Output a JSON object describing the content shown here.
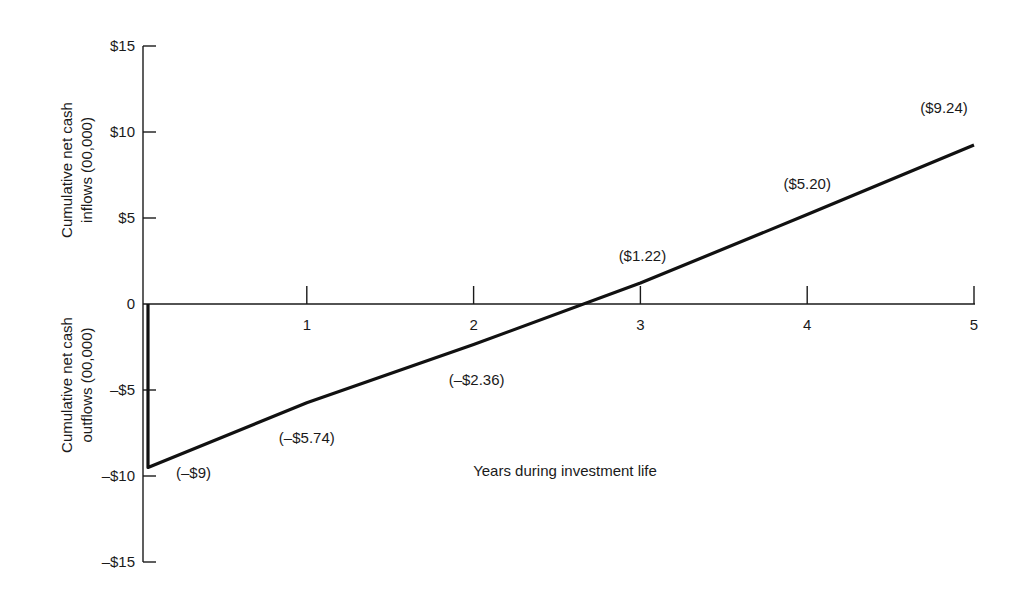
{
  "chart_data": {
    "type": "line",
    "title": "",
    "xlabel": "Years during investment life",
    "ylabel_positive": [
      "Cumulative net cash",
      "inflows (00,000)"
    ],
    "ylabel_negative": [
      "Cumulative net cash",
      "outflows (00,000)"
    ],
    "x": [
      0,
      0,
      1,
      2,
      3,
      4,
      5
    ],
    "y": [
      0,
      -9,
      -5.74,
      -2.36,
      1.22,
      5.2,
      9.24
    ],
    "point_labels": [
      {
        "x": 0,
        "y": -9,
        "label": "(–$9)"
      },
      {
        "x": 1,
        "y": -5.74,
        "label": "(–$5.74)"
      },
      {
        "x": 2,
        "y": -2.36,
        "label": "(–$2.36)"
      },
      {
        "x": 3,
        "y": 1.22,
        "label": "($1.22)"
      },
      {
        "x": 4,
        "y": 5.2,
        "label": "($5.20)"
      },
      {
        "x": 5,
        "y": 9.24,
        "label": "($9.24)"
      }
    ],
    "xticks": [
      1,
      2,
      3,
      4,
      5
    ],
    "xtick_labels": [
      "1",
      "2",
      "3",
      "4",
      "5"
    ],
    "yticks": [
      15,
      10,
      5,
      0,
      -5,
      -10,
      -15
    ],
    "ytick_labels": [
      "$15",
      "$10",
      "$5",
      "0",
      "–$5",
      "–$10",
      "–$15"
    ],
    "xlim": [
      0,
      5
    ],
    "ylim": [
      -15,
      15
    ],
    "grid": false,
    "line_color": "#111111"
  }
}
